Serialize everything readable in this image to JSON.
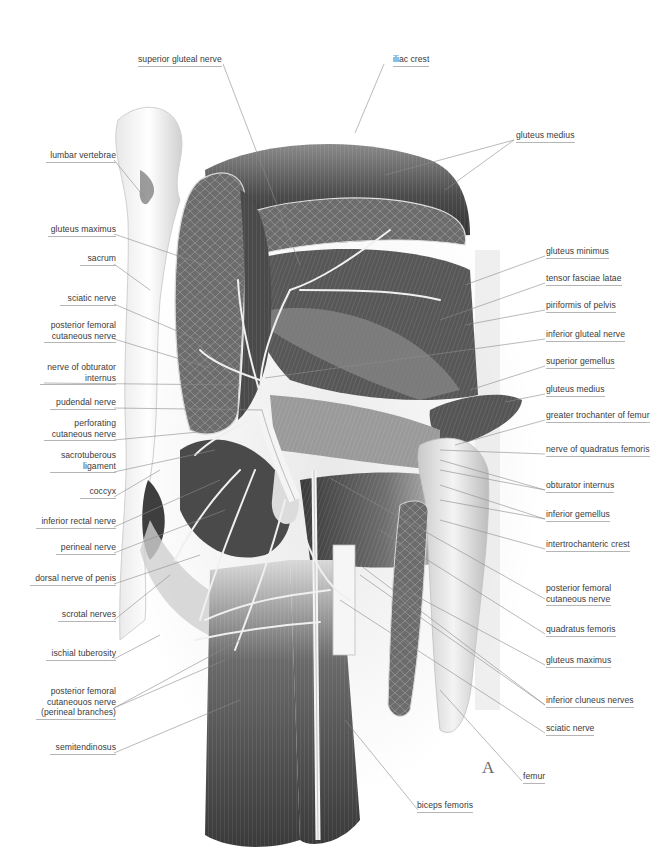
{
  "figure": {
    "plate_letter": "A",
    "colors": {
      "background": "#ffffff",
      "label_text": "#3a3a3a",
      "leader_line": "#8c8c8c",
      "underline": "#b5b5b5",
      "muscle_dark": "#3c3c3c",
      "muscle_mid": "#7a7a7a",
      "bone_light": "#e6e6e6",
      "nerve": "#f2f2f2"
    }
  },
  "labels": {
    "top": {
      "superior_gluteal_nerve": "superior gluteal nerve",
      "iliac_crest": "iliac crest"
    },
    "left": [
      {
        "id": "lumbar-vertebrae",
        "lines": [
          "lumbar vertebrae"
        ]
      },
      {
        "id": "gluteus-maximus",
        "lines": [
          "gluteus maximus"
        ]
      },
      {
        "id": "sacrum",
        "lines": [
          "sacrum"
        ]
      },
      {
        "id": "sciatic-nerve",
        "lines": [
          "sciatic nerve"
        ]
      },
      {
        "id": "posterior-femoral-cutaneous-nerve",
        "lines": [
          "posterior femoral",
          "cutaneous nerve"
        ]
      },
      {
        "id": "nerve-of-obturator-internus",
        "lines": [
          "nerve of obturator",
          "internus"
        ]
      },
      {
        "id": "pudendal-nerve",
        "lines": [
          "pudendal nerve"
        ]
      },
      {
        "id": "perforating-cutaneous-nerve",
        "lines": [
          "perforating",
          "cutaneous nerve"
        ]
      },
      {
        "id": "sacrotuberous-ligament",
        "lines": [
          "sacrotuberous",
          "ligament"
        ]
      },
      {
        "id": "coccyx",
        "lines": [
          "coccyx"
        ]
      },
      {
        "id": "inferior-rectal-nerve",
        "lines": [
          "inferior rectal nerve"
        ]
      },
      {
        "id": "perineal-nerve",
        "lines": [
          "perineal nerve"
        ]
      },
      {
        "id": "dorsal-nerve-of-penis",
        "lines": [
          "dorsal nerve of penis"
        ]
      },
      {
        "id": "scrotal-nerves",
        "lines": [
          "scrotal nerves"
        ]
      },
      {
        "id": "ischial-tuberosity",
        "lines": [
          "ischial tuberosity"
        ]
      },
      {
        "id": "posterior-femoral-cutaneous-nerve-perineal",
        "lines": [
          "posterior femoral",
          "cutaneouos nerve",
          "(perineal branches)"
        ]
      },
      {
        "id": "semitendinosus",
        "lines": [
          "semitendinosus"
        ]
      }
    ],
    "right": [
      {
        "id": "gluteus-medius-top",
        "lines": [
          "gluteus medius"
        ]
      },
      {
        "id": "gluteus-minimus",
        "lines": [
          "gluteus minimus"
        ]
      },
      {
        "id": "tensor-fasciae-latae",
        "lines": [
          "tensor fasciae latae"
        ]
      },
      {
        "id": "piriformis-of-pelvis",
        "lines": [
          "piriformis of pelvis"
        ]
      },
      {
        "id": "inferior-gluteal-nerve",
        "lines": [
          "inferior gluteal nerve"
        ]
      },
      {
        "id": "superior-gemellus",
        "lines": [
          "superior gemellus"
        ]
      },
      {
        "id": "gluteus-medius-lower",
        "lines": [
          "gluteus medius"
        ]
      },
      {
        "id": "greater-trochanter-of-femur",
        "lines": [
          "greater trochanter of femur"
        ]
      },
      {
        "id": "nerve-of-quadratus-femoris",
        "lines": [
          "nerve of quadratus femoris"
        ]
      },
      {
        "id": "obturator-internus",
        "lines": [
          "obturator internus"
        ]
      },
      {
        "id": "inferior-gemellus",
        "lines": [
          "inferior gemellus"
        ]
      },
      {
        "id": "intertrochanteric-crest",
        "lines": [
          "intertrochanteric crest"
        ]
      },
      {
        "id": "posterior-femoral-cutaneous-nerve-right",
        "lines": [
          "posterior femoral",
          "cutaneous nerve"
        ]
      },
      {
        "id": "quadratus-femoris",
        "lines": [
          "quadratus femoris"
        ]
      },
      {
        "id": "gluteus-maximus-right",
        "lines": [
          "gluteus maximus"
        ]
      },
      {
        "id": "inferior-cluneus-nerves",
        "lines": [
          "inferior cluneus nerves"
        ]
      },
      {
        "id": "sciatic-nerve-right",
        "lines": [
          "sciatic nerve"
        ]
      }
    ],
    "bottom": {
      "femur": "femur",
      "biceps_femoris": "biceps femoris"
    }
  }
}
